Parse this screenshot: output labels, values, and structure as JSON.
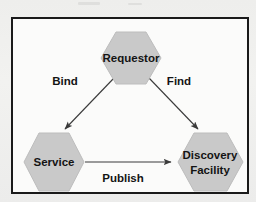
{
  "figure": {
    "kind": "concept-diagram",
    "frame_border_color": "#1a1a1a",
    "frame_background_color": "#fbfbfa",
    "page_background_color": "#f0f0ee"
  },
  "nodes": [
    {
      "id": "requestor",
      "shape": "hexagon",
      "lines": [
        "Requestor"
      ],
      "fill": "#c9c9c9",
      "stroke": "#b4b4b4",
      "cx": 118,
      "cy": 42,
      "rx": 30,
      "ry": 30
    },
    {
      "id": "service",
      "shape": "hexagon",
      "lines": [
        "Service"
      ],
      "fill": "#c9c9c9",
      "stroke": "#b4b4b4",
      "cx": 41,
      "cy": 143,
      "rx": 30,
      "ry": 30
    },
    {
      "id": "discovery-facility",
      "shape": "hexagon",
      "lines": [
        "Discovery",
        "Facility"
      ],
      "fill": "#c9c9c9",
      "stroke": "#b4b4b4",
      "cx": 197,
      "cy": 144,
      "rx": 32,
      "ry": 30
    }
  ],
  "edges": [
    {
      "id": "bind",
      "label": "Bind",
      "from": "requestor",
      "to": "service",
      "label_x": 62,
      "label_y": 79,
      "stroke": "#3a3a3a"
    },
    {
      "id": "find",
      "label": "Find",
      "from": "requestor",
      "to": "discovery-facility",
      "label_x": 176,
      "label_y": 79,
      "stroke": "#3a3a3a"
    },
    {
      "id": "publish",
      "label": "Publish",
      "from": "service",
      "to": "discovery-facility",
      "label_x": 119,
      "label_y": 156,
      "stroke": "#3a3a3a"
    }
  ],
  "text": {
    "requestor": "Requestor",
    "service": "Service",
    "discovery_line1": "Discovery",
    "discovery_line2": "Facility",
    "bind": "Bind",
    "find": "Find",
    "publish": "Publish"
  }
}
